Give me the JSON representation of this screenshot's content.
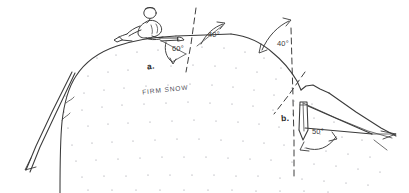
{
  "figure": {
    "kind": "hand-drawn-sketch",
    "background_color": "#ffffff",
    "ink_color": "#3a3a3a",
    "stipple_color": "#8d8d96"
  },
  "labels": {
    "part_a": "a.",
    "part_b": "b.",
    "material": "FIRM SNOW"
  },
  "angles": [
    {
      "id": "angle-left-slope",
      "value": "60°",
      "x": 176,
      "y": 47
    },
    {
      "id": "angle-upper-right",
      "value": "40°",
      "x": 212,
      "y": 33
    },
    {
      "id": "angle-crest",
      "value": "40°",
      "x": 281,
      "y": 43
    },
    {
      "id": "angle-lower-right",
      "value": "50°",
      "x": 315,
      "y": 131
    }
  ],
  "elements": {
    "climber": "seated-climber-figure",
    "rope": "rope-double-line",
    "snow_slope": "stippled-snow-mass",
    "bollard": "snow-anchor-wedge",
    "vertical_references": "dashed-plumb-lines",
    "direction_arrows": "angle-measure-arrows"
  }
}
